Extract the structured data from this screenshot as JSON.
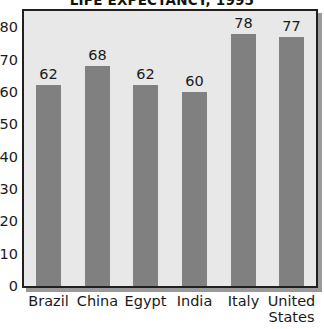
{
  "chart_data": {
    "type": "bar",
    "title": "LIFE EXPECTANCY, 1995",
    "categories": [
      "Brazil",
      "China",
      "Egypt",
      "India",
      "Italy",
      "United States"
    ],
    "category_lines": [
      [
        "Brazil"
      ],
      [
        "China"
      ],
      [
        "Egypt"
      ],
      [
        "India"
      ],
      [
        "Italy"
      ],
      [
        "United",
        "States"
      ]
    ],
    "values": [
      62,
      68,
      62,
      60,
      78,
      77
    ],
    "value_labels": [
      "62",
      "68",
      "62",
      "60",
      "78",
      "77"
    ],
    "xlabel": "",
    "ylabel": "",
    "ylim": [
      0,
      85
    ],
    "y_ticks": [
      0,
      10,
      20,
      30,
      40,
      50,
      60,
      70,
      80
    ],
    "y_tick_labels": [
      "0",
      "10",
      "20",
      "30",
      "40",
      "50",
      "60",
      "70",
      "80"
    ],
    "grid": false,
    "legend": null,
    "bar_color": "#808080",
    "plot_background": "#e8e8e8",
    "frame_color": "#231f20",
    "text_color": "#1a1a1a",
    "page_background": "#ffffff"
  }
}
